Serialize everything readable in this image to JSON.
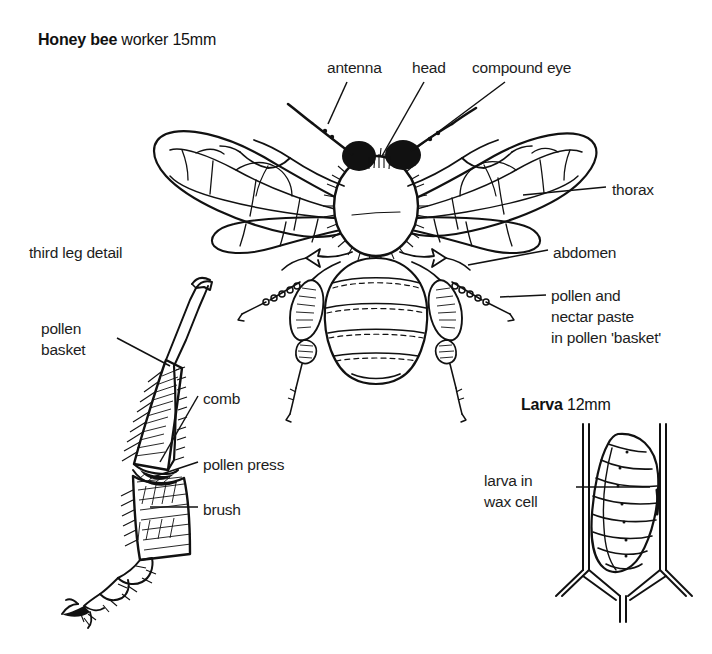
{
  "diagram": {
    "background_color": "#ffffff",
    "ink_color": "#111111",
    "titles": {
      "honeybee_strong": "Honey bee",
      "honeybee_rest": " worker 15mm",
      "larva_strong": "Larva",
      "larva_rest": " 12mm"
    },
    "bee_labels": {
      "antenna": "antenna",
      "head": "head",
      "compound_eye": "compound eye",
      "thorax": "thorax",
      "abdomen": "abdomen",
      "pollen_nectar": "pollen and\nnectar paste\nin pollen 'basket'"
    },
    "leg_labels": {
      "section_title": "third leg detail",
      "pollen_basket": "pollen\nbasket",
      "comb": "comb",
      "pollen_press": "pollen press",
      "brush": "brush"
    },
    "larva_labels": {
      "larva_in_wax_cell": "larva in\nwax cell"
    }
  }
}
